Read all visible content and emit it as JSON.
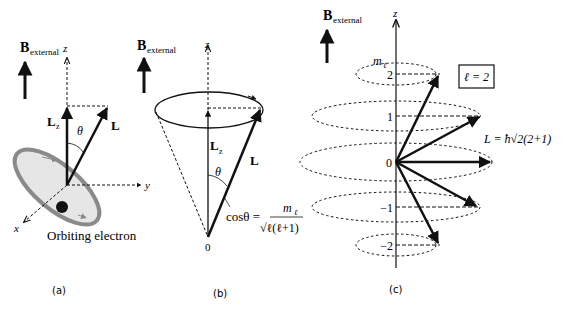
{
  "figure": {
    "panels": [
      {
        "id": "a",
        "caption": "(a)",
        "field_label_main": "B",
        "field_label_sub": "external",
        "z_axis": "z",
        "y_axis": "y",
        "x_axis": "x",
        "lz_main": "L",
        "lz_sub": "z",
        "l_label": "L",
        "theta": "θ",
        "electron_label": "Orbiting electron"
      },
      {
        "id": "b",
        "caption": "(b)",
        "field_label_main": "B",
        "field_label_sub": "external",
        "z_axis": "z",
        "lz_main": "L",
        "lz_sub": "z",
        "l_label": "L",
        "theta": "θ",
        "origin": "0",
        "formula_lhs": "cosθ =",
        "formula_num_main": "m",
        "formula_num_sub": "ℓ",
        "formula_den": "√ℓ(ℓ+1)"
      },
      {
        "id": "c",
        "caption": "(c)",
        "field_label_main": "B",
        "field_label_sub": "external",
        "z_axis": "z",
        "ml_main": "m",
        "ml_sub": "ℓ",
        "ml_values": [
          "2",
          "1",
          "0",
          "−1",
          "−2"
        ],
        "l_box": "ℓ = 2",
        "l_magnitude": "L = ħ√2(2+1)"
      }
    ]
  },
  "colors": {
    "ink": "#111111",
    "orbit_ring": "#8a8a8a",
    "orbit_fill": "#e6e6e6"
  }
}
